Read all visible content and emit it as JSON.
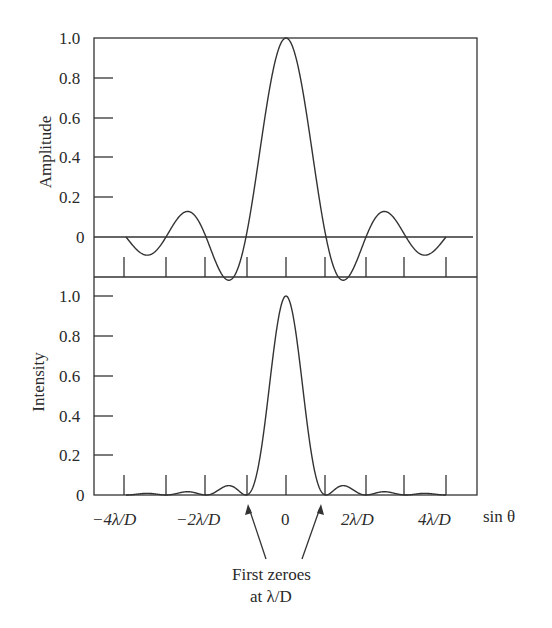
{
  "chart_data": [
    {
      "type": "line",
      "title": "",
      "panel": "top",
      "xlabel": "sin θ",
      "ylabel": "Amplitude",
      "ylim": [
        -0.2,
        1.0
      ],
      "yticks": [
        "1.0",
        "0.8",
        "0.6",
        "0.4",
        "0.2",
        "0"
      ],
      "x_units": "λ/D",
      "xlim": [
        -4,
        4
      ],
      "series": [
        {
          "name": "Amplitude (sinc)",
          "x": [
            -4,
            -3.5,
            -3,
            -2.5,
            -2,
            -1.5,
            -1,
            -0.5,
            0,
            0.5,
            1,
            1.5,
            2,
            2.5,
            3,
            3.5,
            4
          ],
          "values": [
            0,
            -0.09,
            0,
            0.13,
            0,
            -0.22,
            0,
            0.64,
            1.0,
            0.64,
            0,
            -0.22,
            0,
            0.13,
            0,
            -0.09,
            0
          ]
        }
      ],
      "grid": false
    },
    {
      "type": "line",
      "title": "",
      "panel": "bottom",
      "xlabel": "sin θ",
      "ylabel": "Intensity",
      "ylim": [
        0,
        1.0
      ],
      "yticks": [
        "1.0",
        "0.8",
        "0.6",
        "0.4",
        "0.2",
        "0"
      ],
      "x_units": "λ/D",
      "xlim": [
        -4,
        4
      ],
      "xticks": [
        "−4λ/D",
        "−2λ/D",
        "0",
        "2λ/D",
        "4λ/D"
      ],
      "series": [
        {
          "name": "Intensity (sinc²)",
          "x": [
            -4,
            -3.5,
            -3,
            -2.5,
            -2,
            -1.5,
            -1,
            -0.5,
            0,
            0.5,
            1,
            1.5,
            2,
            2.5,
            3,
            3.5,
            4
          ],
          "values": [
            0,
            0.016,
            0,
            0.032,
            0,
            0.047,
            0,
            0.405,
            1.0,
            0.405,
            0,
            0.047,
            0,
            0.032,
            0,
            0.016,
            0
          ]
        }
      ],
      "annotations": [
        {
          "text": "First zeroes at λ/D",
          "points_to": [
            -1,
            1
          ]
        }
      ],
      "grid": false
    }
  ],
  "labels": {
    "top_ylabel": "Amplitude",
    "bottom_ylabel": "Intensity",
    "xlabel": "sin θ",
    "yticks": [
      "1.0",
      "0.8",
      "0.6",
      "0.4",
      "0.2",
      "0"
    ],
    "xticks": [
      "−4λ/D",
      "−2λ/D",
      "0",
      "2λ/D",
      "4λ/D"
    ],
    "annotation_line1": "First zeroes",
    "annotation_line2": "at λ/D"
  }
}
